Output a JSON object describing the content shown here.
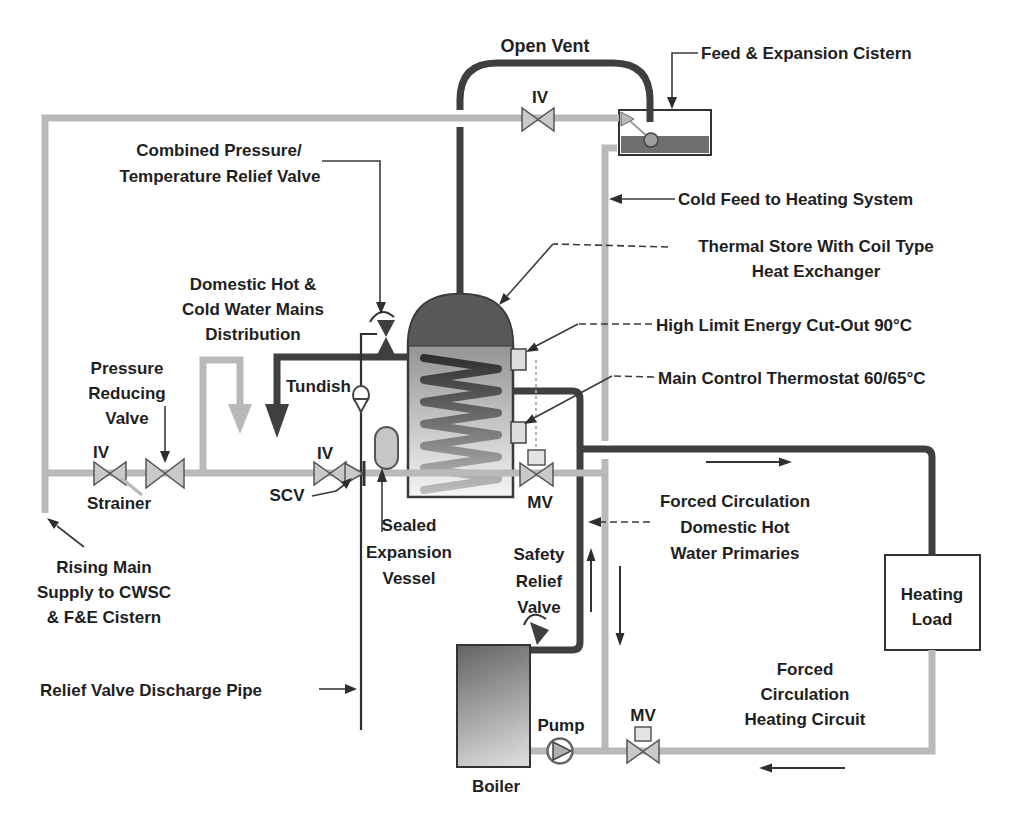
{
  "diagram_title": "Thermal store heating system schematic",
  "colors": {
    "pipe_dark": "#3f3f3f",
    "pipe_light": "#b9b9b9",
    "text": "#1f1f1f",
    "water": "#6f6f6f",
    "component_fill": "#c9c9c9"
  },
  "labels": {
    "open_vent": "Open Vent",
    "iv_top": "IV",
    "feed_expansion_cistern": "Feed & Expansion Cistern",
    "cold_feed": "Cold Feed to Heating System",
    "thermal_store": [
      "Thermal Store With Coil Type",
      "Heat Exchanger"
    ],
    "high_limit": "High Limit Energy Cut-Out 90°C",
    "main_control": "Main Control Thermostat 60/65°C",
    "combined_pt": [
      "Combined Pressure/",
      "Temperature Relief Valve"
    ],
    "domestic_mains": [
      "Domestic Hot &",
      "Cold Water Mains",
      "Distribution"
    ],
    "pressure_reducing": [
      "Pressure",
      "Reducing",
      "Valve"
    ],
    "iv_left": "IV",
    "strainer": "Strainer",
    "iv_mid": "IV",
    "scv": "SCV",
    "tundish": "Tundish",
    "sealed_vessel": [
      "Sealed",
      "Expansion",
      "Vessel"
    ],
    "rising_main": [
      "Rising Main",
      "Supply to CWSC",
      "& F&E Cistern"
    ],
    "relief_discharge": "Relief Valve Discharge Pipe",
    "safety_relief": [
      "Safety",
      "Relief",
      "Valve"
    ],
    "mv_store": "MV",
    "mv_bottom": "MV",
    "pump": "Pump",
    "boiler": "Boiler",
    "forced_dhw": [
      "Forced Circulation",
      "Domestic Hot",
      "Water Primaries"
    ],
    "forced_heating": [
      "Forced",
      "Circulation",
      "Heating Circuit"
    ],
    "heating_load": [
      "Heating",
      "Load"
    ]
  }
}
